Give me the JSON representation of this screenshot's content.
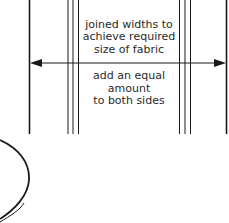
{
  "diagram": {
    "upper_label": [
      "joined widths to",
      "achieve required",
      "size of fabric"
    ],
    "lower_label": [
      "add an equal",
      "amount",
      "to both sides"
    ],
    "colors": {
      "line": "#1a1a1a",
      "text": "#2a2a2a",
      "background": "#ffffff"
    },
    "elements": {
      "outer_edges": "fabric-outer-edge lines (left and right)",
      "seams": "triple seam lines on each side",
      "arrow": "double-headed width arrow",
      "curve": "partial ellipse at bottom-left"
    }
  }
}
